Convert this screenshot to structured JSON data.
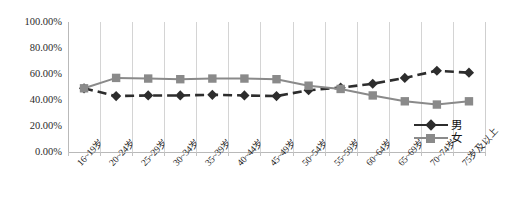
{
  "chart_data": {
    "type": "line",
    "title": "",
    "xlabel": "",
    "ylabel": "",
    "ylim": [
      0,
      100
    ],
    "ytick_labels": [
      "100.00%",
      "80.00%",
      "60.00%",
      "40.00%",
      "20.00%",
      "0.00%"
    ],
    "ytick_values": [
      100,
      80,
      60,
      40,
      20,
      0
    ],
    "grid": "vertical",
    "legend_position": "bottom-right",
    "categories": [
      "16~19岁",
      "20~24岁",
      "25~29岁",
      "30~34岁",
      "35~39岁",
      "40~44岁",
      "45~49岁",
      "50~54岁",
      "55~59岁",
      "60~64岁",
      "65~69岁",
      "70~74岁",
      "75岁及以上"
    ],
    "series": [
      {
        "name": "男",
        "color": "#2d2d2d",
        "marker": "diamond",
        "dash": true,
        "values": [
          49.0,
          43.0,
          43.5,
          43.5,
          44.0,
          43.5,
          43.0,
          47.5,
          49.5,
          52.5,
          57.0,
          62.5,
          61.0
        ]
      },
      {
        "name": "女",
        "color": "#8a8a8a",
        "marker": "square",
        "dash": false,
        "values": [
          49.0,
          57.0,
          56.5,
          56.0,
          56.5,
          56.5,
          56.0,
          51.0,
          48.5,
          43.5,
          39.0,
          36.5,
          39.0
        ]
      }
    ]
  },
  "legend": {
    "items": [
      {
        "label": "男"
      },
      {
        "label": "女"
      }
    ]
  }
}
